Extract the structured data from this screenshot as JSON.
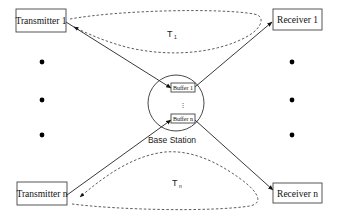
{
  "diagram": {
    "transmitters": [
      {
        "label": "Transmitter 1"
      },
      {
        "label": "Transmitter n"
      }
    ],
    "receivers": [
      {
        "label": "Receiver 1"
      },
      {
        "label": "Receiver n"
      }
    ],
    "base_station": {
      "label": "Base Station",
      "buffers": [
        {
          "label": "Buffer 1"
        },
        {
          "label": "Buffer n"
        }
      ],
      "ellipsis": "⋮"
    },
    "cycles": [
      {
        "label": "T",
        "subscript": "1"
      },
      {
        "label": "T",
        "subscript": "n"
      }
    ],
    "ellipsis_dots_per_side": 3
  }
}
